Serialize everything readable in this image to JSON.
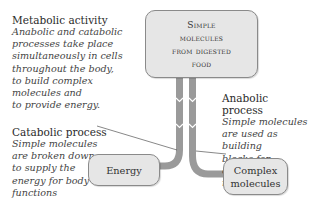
{
  "intro": {
    "title": "Metabolic activity",
    "lines": [
      "Anabolic and catabolic",
      "processes take place",
      "simultaneously in cells",
      "throughout the body,",
      "to build complex",
      "molecules and",
      "to provide energy."
    ]
  },
  "source_box": {
    "lines": [
      "Simple",
      "molecules",
      "from digested",
      "food"
    ]
  },
  "catabolic": {
    "title": "Catabolic process",
    "lines": [
      "Simple molecules",
      "are broken down",
      "to supply the",
      "energy for body",
      "functions"
    ]
  },
  "anabolic": {
    "title": "Anabolic process",
    "lines": [
      "Simple molecules",
      "are used as building",
      "blocks for complex",
      "molecules"
    ]
  },
  "energy_box": {
    "label": "Energy"
  },
  "complex_box": {
    "lines": [
      "Complex",
      "molecules"
    ]
  },
  "colors": {
    "box_fill": "#e6e6e6",
    "box_border": "#8a8a8a",
    "arrow": "#9a9a9a",
    "text": "#333333"
  }
}
